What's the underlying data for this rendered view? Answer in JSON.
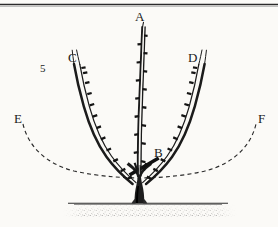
{
  "figure": {
    "number": "5",
    "background_color": "#fbfaf7",
    "ink_color": "#1a1a1a",
    "width": 278,
    "height": 227
  },
  "top_rule": {
    "name": "top-horizontal-rule",
    "color": "#2b2b2b"
  },
  "labels": [
    {
      "id": "A",
      "text": "A",
      "role": "central-leader-label",
      "x": 135,
      "y": 10
    },
    {
      "id": "B",
      "text": "B",
      "role": "pruning-cut-label",
      "x": 154,
      "y": 146
    },
    {
      "id": "C",
      "text": "C",
      "role": "left-scaffold-branch-label",
      "x": 68,
      "y": 51
    },
    {
      "id": "D",
      "text": "D",
      "role": "right-scaffold-branch-label",
      "x": 188,
      "y": 51
    },
    {
      "id": "E",
      "text": "E",
      "role": "left-dashed-arc-label",
      "x": 14,
      "y": 112
    },
    {
      "id": "F",
      "text": "F",
      "role": "right-dashed-arc-label",
      "x": 258,
      "y": 112
    }
  ],
  "drawing": {
    "type": "line-art-diagram",
    "subject": "pruned young fruit tree with central leader and two scaffold branches",
    "central_leader": {
      "name": "central-leader-stem",
      "path": "M 139,196 L 139,176 C 139,150 140,120 141,92 C 142,68 143,46 144,26",
      "bud_count": 16
    },
    "left_branch": {
      "name": "left-scaffold-branch",
      "path": "M 133,188 C 124,180 114,170 104,156 C 94,142 86,122 80,102 C 76,88 74,76 73,64",
      "bud_count": 12
    },
    "right_branch": {
      "name": "right-scaffold-branch",
      "path": "M 145,188 C 155,180 165,170 175,156 C 185,142 192,122 197,102 C 200,88 202,76 203,64",
      "bud_count": 12
    },
    "trunk": {
      "name": "trunk-base",
      "description": "thick vertical trunk flaring at soil line"
    },
    "stubs": {
      "name": "pruned-stub-marks",
      "count": 2
    },
    "pointer_line": {
      "name": "b-pointer-line",
      "from_x": 130,
      "from_y": 172,
      "to_x": 158,
      "to_y": 158
    },
    "dashed_arc": {
      "name": "dashed-reference-arc",
      "path": "M 23,124 C 30,150 60,172 100,175 C 120,177 160,177 180,175 C 220,172 248,150 256,124",
      "dash": "4 3"
    },
    "ground": {
      "name": "soil-line",
      "y": 203,
      "x_start": 68,
      "x_end": 228,
      "texture": "stippled-soil"
    }
  }
}
